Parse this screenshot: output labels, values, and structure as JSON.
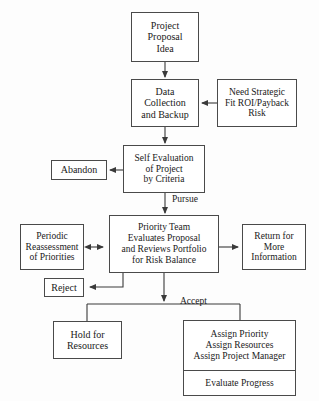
{
  "diagram": {
    "colors": {
      "background": "#fdfdfd",
      "box_fill": "#ffffff",
      "border": "#4a4a4a",
      "text": "#1a1a1a",
      "connector": "#3a3a3a"
    },
    "nodes": [
      {
        "id": "project-proposal-idea",
        "name": "node-project-proposal-idea",
        "lines": [
          "Project",
          "Proposal",
          "Idea"
        ],
        "x": 131,
        "y": 12,
        "w": 68,
        "h": 50,
        "font_size": 10
      },
      {
        "id": "data-collection",
        "name": "node-data-collection-and-backup",
        "lines": [
          "Data",
          "Collection",
          "and Backup"
        ],
        "x": 131,
        "y": 79,
        "w": 68,
        "h": 48,
        "font_size": 10
      },
      {
        "id": "need-strategic-fit",
        "name": "node-need-strategic-fit",
        "lines": [
          "Need Strategic",
          "Fit ROI/Payback",
          "Risk"
        ],
        "x": 217,
        "y": 79,
        "w": 80,
        "h": 48,
        "font_size": 9.5
      },
      {
        "id": "self-evaluation",
        "name": "node-self-evaluation-of-project",
        "lines": [
          "Self Evaluation",
          "of Project",
          "by Criteria"
        ],
        "x": 123,
        "y": 145,
        "w": 82,
        "h": 48,
        "font_size": 9.5
      },
      {
        "id": "abandon",
        "name": "node-abandon",
        "lines": [
          "Abandon"
        ],
        "x": 51,
        "y": 160,
        "w": 56,
        "h": 20,
        "font_size": 10
      },
      {
        "id": "priority-team",
        "name": "node-priority-team-evaluates",
        "lines": [
          "Priority Team",
          "Evaluates Proposal",
          "and Reviews Portfolio",
          "for Risk Balance"
        ],
        "x": 109,
        "y": 215,
        "w": 110,
        "h": 58,
        "font_size": 9.5
      },
      {
        "id": "periodic-reassessment",
        "name": "node-periodic-reassessment",
        "lines": [
          "Periodic",
          "Reassessment",
          "of Priorities"
        ],
        "x": 20,
        "y": 224,
        "w": 64,
        "h": 46,
        "font_size": 9.5
      },
      {
        "id": "return-for-more-info",
        "name": "node-return-for-more-information",
        "lines": [
          "Return for",
          "More",
          "Information"
        ],
        "x": 242,
        "y": 224,
        "w": 64,
        "h": 46,
        "font_size": 9.5
      },
      {
        "id": "reject",
        "name": "node-reject",
        "lines": [
          "Reject"
        ],
        "x": 44,
        "y": 278,
        "w": 40,
        "h": 19,
        "font_size": 10
      },
      {
        "id": "hold-for-resources",
        "name": "node-hold-for-resources",
        "lines": [
          "Hold for",
          "Resources"
        ],
        "x": 53,
        "y": 321,
        "w": 69,
        "h": 38,
        "font_size": 10
      }
    ],
    "split_node": {
      "id": "assign-and-evaluate",
      "name": "node-assign-priority-resources-manager",
      "top_lines": [
        "Assign Priority",
        "Assign Resources",
        "Assign Project Manager"
      ],
      "bottom_line": "Evaluate Progress",
      "x": 183,
      "y": 320,
      "w": 113,
      "h": 76,
      "font_size": 9.5
    },
    "edge_labels": [
      {
        "id": "pursue",
        "name": "edge-label-pursue",
        "text": "Pursue",
        "x": 172,
        "y": 194,
        "font_size": 9.5
      },
      {
        "id": "accept",
        "name": "edge-label-accept",
        "text": "Accept",
        "x": 180,
        "y": 297,
        "font_size": 9.5
      }
    ],
    "connections": [
      {
        "from": "project-proposal-idea",
        "to": "data-collection",
        "type": "arrow-down"
      },
      {
        "from": "need-strategic-fit",
        "to": "data-collection",
        "type": "arrow-left"
      },
      {
        "from": "data-collection",
        "to": "self-evaluation",
        "type": "arrow-down"
      },
      {
        "from": "self-evaluation",
        "to": "abandon",
        "type": "arrow-left"
      },
      {
        "from": "self-evaluation",
        "to": "priority-team",
        "type": "arrow-down",
        "label": "Pursue"
      },
      {
        "from": "periodic-reassessment",
        "to": "priority-team",
        "type": "arrow-bidirectional"
      },
      {
        "from": "priority-team",
        "to": "return-for-more-info",
        "type": "arrow-right"
      },
      {
        "from": "priority-team",
        "to": "reject",
        "type": "elbow-arrow-left"
      },
      {
        "from": "priority-team",
        "to": "hold-for-resources",
        "type": "branch-down",
        "label": "Accept"
      },
      {
        "from": "priority-team",
        "to": "assign-and-evaluate",
        "type": "branch-down",
        "label": "Accept"
      }
    ]
  }
}
